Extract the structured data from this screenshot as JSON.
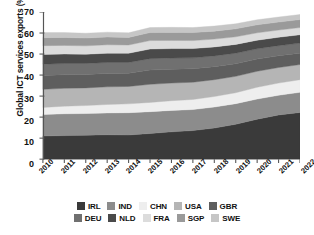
{
  "axes": {
    "ylabel": "Global ICT services exports (%)",
    "yticks": [
      "0",
      "10",
      "20",
      "30",
      "40",
      "50",
      "60",
      "70"
    ],
    "xticks": [
      "2010",
      "2011",
      "2012",
      "2013",
      "2014",
      "2015",
      "2016",
      "2017",
      "2018",
      "2019",
      "2020",
      "2021",
      "2022"
    ]
  },
  "legend": {
    "row1": [
      {
        "label": "IRL",
        "color": "#3a3a3a"
      },
      {
        "label": "IND",
        "color": "#8c8c8c"
      },
      {
        "label": "CHN",
        "color": "#eeeeee"
      },
      {
        "label": "USA",
        "color": "#b5b5b5"
      },
      {
        "label": "GBR",
        "color": "#5e5e5e"
      }
    ],
    "row2": [
      {
        "label": "DEU",
        "color": "#707070"
      },
      {
        "label": "NLD",
        "color": "#4a4a4a"
      },
      {
        "label": "FRA",
        "color": "#dcdcdc"
      },
      {
        "label": "SGP",
        "color": "#9a9a9a"
      },
      {
        "label": "SWE",
        "color": "#c6c6c6"
      }
    ]
  },
  "chart_data": {
    "type": "area",
    "title": "",
    "xlabel": "",
    "ylabel": "Global ICT services exports (%)",
    "ylim": [
      0,
      70
    ],
    "grid": false,
    "legend_position": "bottom",
    "stacked": true,
    "x": [
      "2010",
      "2011",
      "2012",
      "2013",
      "2014",
      "2015",
      "2016",
      "2017",
      "2018",
      "2019",
      "2020",
      "2021",
      "2022"
    ],
    "series": [
      {
        "name": "IRL",
        "color": "#3a3a3a",
        "values": [
          11.0,
          11.2,
          11.4,
          11.6,
          11.5,
          12.2,
          13.0,
          13.6,
          14.8,
          16.6,
          19.0,
          21.0,
          22.2
        ]
      },
      {
        "name": "IND",
        "color": "#8c8c8c",
        "values": [
          10.2,
          10.4,
          10.3,
          10.4,
          10.6,
          10.4,
          10.2,
          10.0,
          10.0,
          9.8,
          9.6,
          9.4,
          9.6
        ]
      },
      {
        "name": "CHN",
        "color": "#eeeeee",
        "values": [
          3.4,
          3.6,
          3.8,
          4.0,
          4.2,
          4.4,
          4.6,
          4.8,
          5.0,
          5.2,
          5.6,
          5.8,
          6.0
        ]
      },
      {
        "name": "USA",
        "color": "#b5b5b5",
        "values": [
          8.6,
          8.5,
          8.4,
          8.4,
          8.3,
          8.6,
          8.4,
          8.2,
          8.0,
          7.8,
          7.6,
          7.4,
          7.2
        ]
      },
      {
        "name": "GBR",
        "color": "#5e5e5e",
        "values": [
          6.6,
          6.5,
          6.4,
          6.4,
          6.3,
          6.8,
          6.6,
          6.4,
          6.2,
          6.0,
          5.8,
          5.6,
          5.4
        ]
      },
      {
        "name": "DEU",
        "color": "#707070",
        "values": [
          5.4,
          5.3,
          5.2,
          5.2,
          5.1,
          5.4,
          5.3,
          5.2,
          5.1,
          5.0,
          4.9,
          4.8,
          4.8
        ]
      },
      {
        "name": "NLD",
        "color": "#4a4a4a",
        "values": [
          4.6,
          4.5,
          4.4,
          4.4,
          4.4,
          4.6,
          4.5,
          4.4,
          4.3,
          4.2,
          4.1,
          4.0,
          4.0
        ]
      },
      {
        "name": "FRA",
        "color": "#dcdcdc",
        "values": [
          4.2,
          4.1,
          4.0,
          4.0,
          3.9,
          4.0,
          3.9,
          3.8,
          3.7,
          3.6,
          3.5,
          3.4,
          3.4
        ]
      },
      {
        "name": "SGP",
        "color": "#9a9a9a",
        "values": [
          3.8,
          3.8,
          3.7,
          3.7,
          3.6,
          3.8,
          3.8,
          3.8,
          3.8,
          3.8,
          3.8,
          3.8,
          3.8
        ]
      },
      {
        "name": "SWE",
        "color": "#c6c6c6",
        "values": [
          2.4,
          2.3,
          2.3,
          2.3,
          2.2,
          2.4,
          2.4,
          2.4,
          2.4,
          2.4,
          2.4,
          2.4,
          2.4
        ]
      }
    ]
  }
}
